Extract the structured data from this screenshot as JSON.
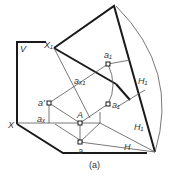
{
  "diagram": {
    "colors": {
      "heavy": "#1a1a1a",
      "thin": "#555555",
      "text": "#333333",
      "background": "#ffffff"
    },
    "labels": {
      "V": "V",
      "X": "X",
      "X1": "X₁",
      "a1_prime": "a₁",
      "a_x1": "aₓ₁",
      "H1_top": "H₁",
      "a_prime": "a′",
      "a1": "a₁",
      "a_x": "aₓ",
      "A": "A",
      "H1_bottom": "H₁",
      "a": "a",
      "H": "H"
    },
    "caption": "(a)"
  }
}
